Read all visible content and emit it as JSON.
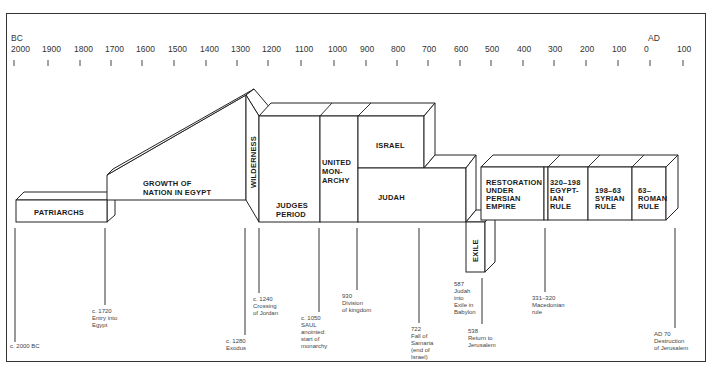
{
  "axis": {
    "era_left": "BC",
    "era_right": "AD",
    "ticks": [
      {
        "label": "2000",
        "x": 14
      },
      {
        "label": "1900",
        "x": 48
      },
      {
        "label": "1800",
        "x": 80
      },
      {
        "label": "1700",
        "x": 111
      },
      {
        "label": "1600",
        "x": 142
      },
      {
        "label": "1500",
        "x": 174
      },
      {
        "label": "1400",
        "x": 206
      },
      {
        "label": "1300",
        "x": 237
      },
      {
        "label": "1200",
        "x": 268
      },
      {
        "label": "1100",
        "x": 301
      },
      {
        "label": "1000",
        "x": 334
      },
      {
        "label": "900",
        "x": 366
      },
      {
        "label": "800",
        "x": 397
      },
      {
        "label": "700",
        "x": 428
      },
      {
        "label": "600",
        "x": 460
      },
      {
        "label": "500",
        "x": 491
      },
      {
        "label": "400",
        "x": 523
      },
      {
        "label": "300",
        "x": 554
      },
      {
        "label": "200",
        "x": 586
      },
      {
        "label": "100",
        "x": 618
      },
      {
        "label": "0",
        "x": 650
      },
      {
        "label": "100",
        "x": 683
      }
    ]
  },
  "eras": {
    "patriarchs": "PATRIARCHS",
    "egypt_1": "GROWTH OF",
    "egypt_2": "NATION IN EGYPT",
    "wilderness": "WILDERNESS",
    "judges_1": "JUDGES",
    "judges_2": "PERIOD",
    "united_1": "UNITED",
    "united_2": "MON-",
    "united_3": "ARCHY",
    "israel": "ISRAEL",
    "judah": "JUDAH",
    "exile": "EXILE",
    "persian_1": "RESTORATION",
    "persian_2": "UNDER",
    "persian_3": "PERSIAN",
    "persian_4": "EMPIRE",
    "egyptian_1": "320–198",
    "egyptian_2": "EGYPT-",
    "egyptian_3": "IAN",
    "egyptian_4": "RULE",
    "syrian_1": "198–63",
    "syrian_2": "SYRIAN",
    "syrian_3": "RULE",
    "roman_1": "63–",
    "roman_2": "ROMAN",
    "roman_3": "RULE"
  },
  "annotations": {
    "a2000": [
      "c. 2000 BC"
    ],
    "a1720": [
      "c. 1720",
      "Entry into",
      "Egypt"
    ],
    "a1280": [
      "c. 1280",
      "Exodus"
    ],
    "a1240": [
      "c. 1240",
      "Crossing",
      "of Jordan"
    ],
    "a1050": [
      "c. 1050",
      "SAUL",
      "anointed:",
      "start of",
      "monarchy"
    ],
    "a930": [
      "930",
      "Division",
      "of kingdom"
    ],
    "a722": [
      "722",
      "Fall of",
      "Samaria",
      "(end of",
      "Israel)"
    ],
    "a587": [
      "587",
      "Judah",
      "into",
      "Exile in",
      "Babylon"
    ],
    "a538": [
      "538",
      "Return to",
      "Jerusalem"
    ],
    "a331": [
      "331–320",
      "Macedonian",
      "rule"
    ],
    "a70": [
      "AD 70",
      "Destruction",
      "of Jerusalem"
    ]
  }
}
